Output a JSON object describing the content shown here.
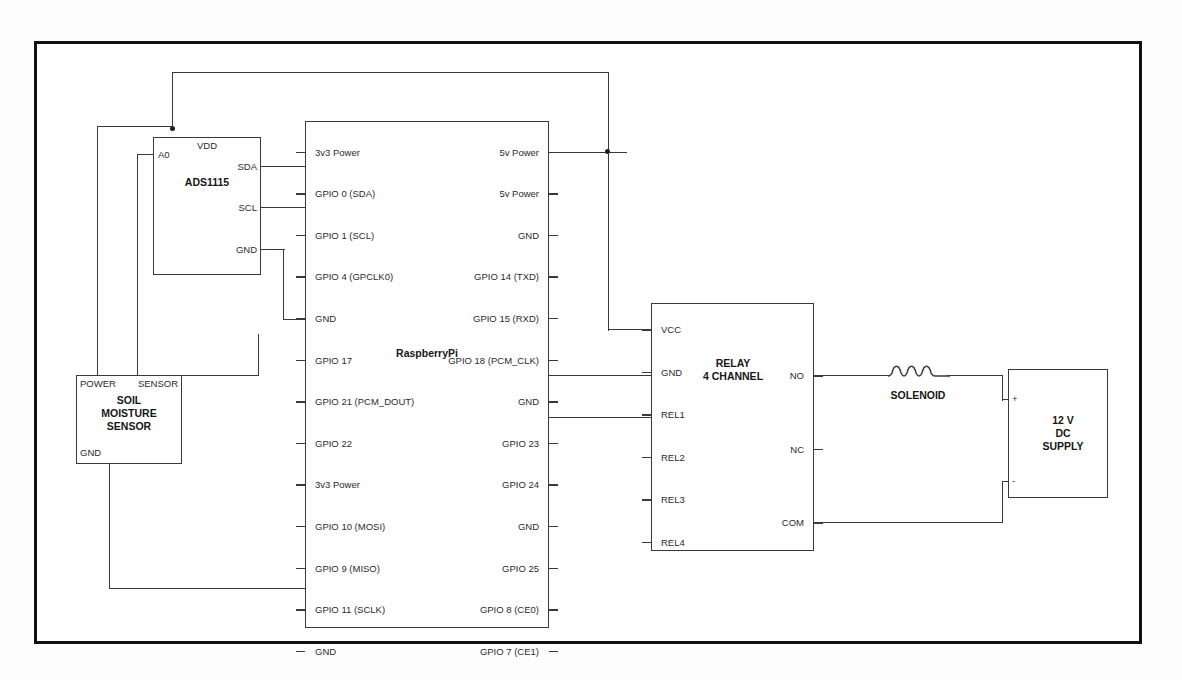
{
  "diagram": {
    "background": "#ffffff",
    "line_color": "#3a3a3a",
    "border_color": "#111111"
  },
  "blocks": {
    "ads1115": {
      "name": "ADS1115",
      "pins": {
        "vdd": "VDD",
        "a0": "A0",
        "sda": "SDA",
        "scl": "SCL",
        "gnd": "GND"
      }
    },
    "raspberrypi": {
      "name": "RaspberryPi",
      "left_pins": [
        "3v3 Power",
        "GPIO 0 (SDA)",
        "GPIO 1 (SCL)",
        "GPIO 4 (GPCLK0)",
        "GND",
        "GPIO 17",
        "GPIO 21 (PCM_DOUT)",
        "GPIO 22",
        "3v3 Power",
        "GPIO 10 (MOSI)",
        "GPIO 9 (MISO)",
        "GPIO 11 (SCLK)",
        "GND"
      ],
      "right_pins": [
        "5v Power",
        "5v Power",
        "GND",
        "GPIO 14 (TXD)",
        "GPIO 15 (RXD)",
        "GPIO 18 (PCM_CLK)",
        "GND",
        "GPIO 23",
        "GPIO 24",
        "GND",
        "GPIO 25",
        "GPIO 8 (CE0)",
        "GPIO 7 (CE1)"
      ]
    },
    "soil_sensor": {
      "name_line1": "SOIL",
      "name_line2": "MOISTURE",
      "name_line3": "SENSOR",
      "pins": {
        "power": "POWER",
        "sensor": "SENSOR",
        "gnd": "GND"
      }
    },
    "relay": {
      "name_line1": "RELAY",
      "name_line2": "4 CHANNEL",
      "left_pins": [
        "VCC",
        "GND",
        "REL1",
        "REL2",
        "REL3",
        "REL4"
      ],
      "right_pins": [
        "NO",
        "NC",
        "COM"
      ]
    },
    "solenoid": {
      "label": "SOLENOID"
    },
    "supply": {
      "name_line1": "12 V",
      "name_line2": "DC",
      "name_line3": "SUPPLY",
      "terminal_plus": "+",
      "terminal_minus": "-"
    }
  }
}
